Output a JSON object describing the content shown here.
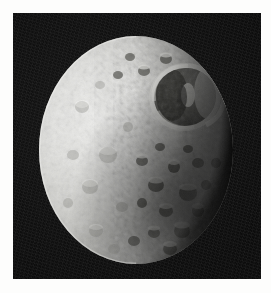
{
  "figure": {
    "subject": "Mimas",
    "alt_text": "Grayscale spacecraft image of Saturn's moon Mimas showing the giant Herschel impact crater",
    "image_type": "photograph",
    "color_mode": "grayscale",
    "page_background_color": "#fdfdfc",
    "sky_background_color": "#0c0c0c"
  },
  "plate": {
    "left": 13,
    "top": 13,
    "width": 248,
    "height": 266
  },
  "body": {
    "name": "Mimas",
    "shape": "sphere",
    "phase": "gibbous",
    "illumination_direction": "left",
    "terminator_side": "right",
    "limb_color": "#ececea",
    "midtone_color": "#b9b9b6",
    "shadow_color": "#262624",
    "disk": {
      "center_x": 120,
      "center_y": 150,
      "radius_x": 98,
      "radius_y": 115
    }
  },
  "features": [
    {
      "name": "Herschel crater",
      "type": "impact-crater",
      "center_x": 172,
      "center_y": 97,
      "radius": 31,
      "rim_color": "#d8d8d4",
      "floor_color": "#4b4b47",
      "has_central_peak": true
    },
    {
      "name": "cratered terrain",
      "type": "terrain",
      "description": "heavily cratered surface across the full disk"
    },
    {
      "name": "terminator",
      "type": "shadow-boundary",
      "description": "night side fading into darkness along the right limb"
    }
  ]
}
